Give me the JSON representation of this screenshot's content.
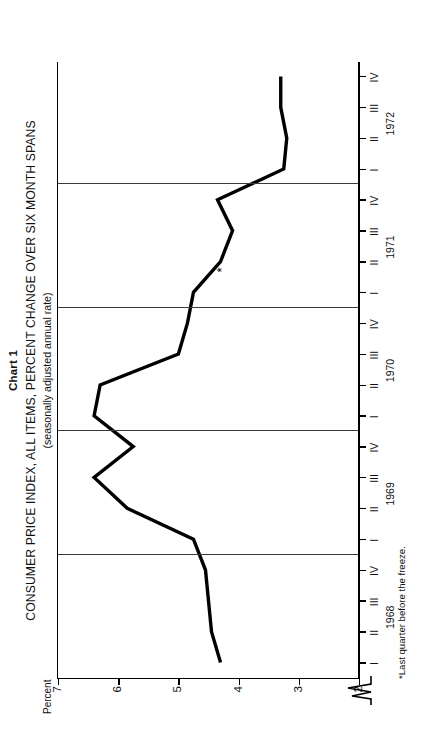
{
  "titles": {
    "chart_number": "Chart 1",
    "main": "CONSUMER PRICE INDEX, ALL ITEMS, PERCENT CHANGE OVER SIX MONTH SPANS",
    "subtitle": "(seasonally adjusted annual rate)"
  },
  "axis": {
    "y_caption": "Percent"
  },
  "footnote": "*Last quarter before the freeze.",
  "chart_data": {
    "type": "line",
    "title": "CONSUMER PRICE INDEX, ALL ITEMS, PERCENT CHANGE OVER SIX MONTH SPANS",
    "subtitle": "(seasonally adjusted annual rate)",
    "xlabel": "",
    "ylabel": "Percent",
    "ylim": [
      2,
      7
    ],
    "yticks": [
      7,
      6,
      5,
      4,
      3,
      2
    ],
    "ytick_labels": [
      "7",
      "6",
      "5",
      "4",
      "3",
      "2"
    ],
    "grid": "vertical-year-separators",
    "legend": "none",
    "years": [
      "1968",
      "1969",
      "1970",
      "1971",
      "1972"
    ],
    "quarters": [
      "I",
      "II",
      "III",
      "IV"
    ],
    "x": [
      "1968 I",
      "1968 II",
      "1968 III",
      "1968 IV",
      "1969 I",
      "1969 II",
      "1969 III",
      "1969 IV",
      "1970 I",
      "1970 II",
      "1970 III",
      "1970 IV",
      "1971 I",
      "1971 II",
      "1971 III",
      "1971 IV",
      "1972 I",
      "1972 II",
      "1972 III",
      "1972 IV"
    ],
    "values": [
      4.3,
      4.45,
      4.5,
      4.55,
      4.75,
      5.85,
      6.4,
      5.75,
      6.4,
      6.3,
      5.0,
      4.85,
      4.75,
      4.3,
      4.1,
      4.35,
      3.25,
      3.2,
      3.3,
      3.3
    ],
    "annotations": [
      {
        "label": "*",
        "x": "1971 II",
        "value": 4.1,
        "note": "Last quarter before the freeze."
      }
    ],
    "axis_breaks": [
      "y-axis below 2"
    ]
  }
}
